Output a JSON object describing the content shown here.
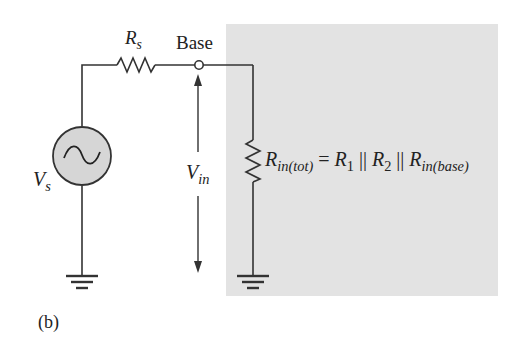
{
  "diagram": {
    "labels": {
      "rs_main": "R",
      "rs_sub": "s",
      "base": "Base",
      "vs_main": "V",
      "vs_sub": "s",
      "vin_main": "V",
      "vin_sub": "in",
      "eq_r1": "R",
      "eq_r1_sub": "in(tot)",
      "eq_eq": " = ",
      "eq_r2": "R",
      "eq_r2_sub": "1",
      "eq_par1": " || ",
      "eq_r3": "R",
      "eq_r3_sub": "2",
      "eq_par2": " || ",
      "eq_r4": "R",
      "eq_r4_sub": "in(base)",
      "caption": "(b)"
    },
    "colors": {
      "shade": "#e3e3e3",
      "line": "#333333",
      "source_fill": "#d6d6d6"
    }
  }
}
